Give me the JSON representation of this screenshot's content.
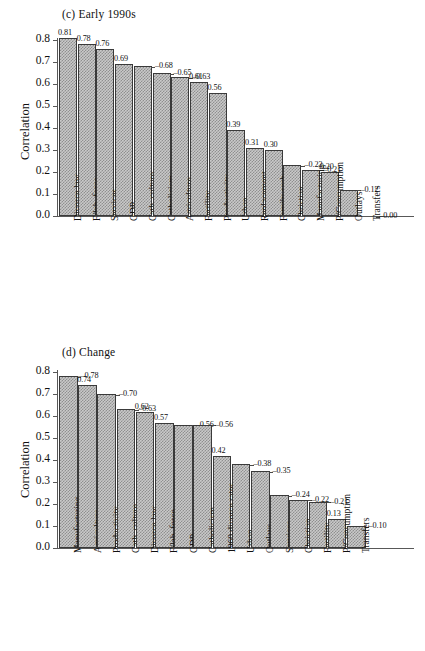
{
  "figure": {
    "ylabel": "Correlation",
    "y_ticks": [
      "0.0",
      "0.1",
      "0.2",
      "0.3",
      "0.4",
      "0.5",
      "0.6",
      "0.7",
      "0.8"
    ]
  },
  "chart_data": [
    {
      "type": "bar",
      "title": "(c) Early 1990s",
      "xlabel": "",
      "ylabel": "Correlation",
      "ylim": [
        0.0,
        0.8
      ],
      "yticks": [
        0.0,
        0.1,
        0.2,
        0.3,
        0.4,
        0.5,
        0.6,
        0.7,
        0.8
      ],
      "grid": false,
      "legend": "none",
      "categories": [
        "Divorce law",
        "F/lab. force",
        "Services",
        "GDP",
        "Cath. culture",
        "Catholicism",
        "Agriculture",
        "Fertility",
        "Productivity",
        "Urban",
        "Replacement",
        "Family cash",
        "Christian",
        "Manufacturing",
        "P/Consumption",
        "Outlays",
        "Transfers"
      ],
      "values": [
        0.81,
        0.78,
        0.76,
        0.69,
        0.68,
        0.65,
        0.63,
        0.61,
        0.56,
        0.39,
        0.31,
        0.3,
        0.23,
        0.21,
        0.2,
        0.12,
        0.0
      ],
      "labels": [
        "0.81",
        "0.78",
        "0.76",
        "0.69",
        "–0.68",
        "–0.65",
        "–0.63",
        "0.61",
        "0.56",
        "0.39",
        "0.31",
        "0.30",
        "–0.23",
        "–0.21",
        "0.20",
        "–0.12",
        "–0.00"
      ]
    },
    {
      "type": "bar",
      "title": "(d) Change",
      "xlabel": "",
      "ylabel": "Correlation",
      "ylim": [
        0.0,
        0.8
      ],
      "yticks": [
        0.0,
        0.1,
        0.2,
        0.3,
        0.4,
        0.5,
        0.6,
        0.7,
        0.8
      ],
      "grid": false,
      "legend": "none",
      "categories": [
        "Manufacturing",
        "Agriculture",
        "Productivity",
        "Cath. culture",
        "Divorce law",
        "F/lab. force",
        "GDP",
        "Catholicism",
        "1960 divorce rates",
        "Urban",
        "Outlays",
        "Services",
        "Christian",
        "Fertility",
        "P/Consumption",
        "Transfers"
      ],
      "values": [
        0.78,
        0.74,
        0.7,
        0.63,
        0.62,
        0.57,
        0.56,
        0.56,
        0.42,
        0.38,
        0.35,
        0.24,
        0.22,
        0.21,
        0.13,
        0.1
      ],
      "labels": [
        "–0.78",
        "0.74",
        "–0.70",
        "–0.63",
        "0.62",
        "0.57",
        "–0.56",
        "–0.56",
        "0.42",
        "–0.38",
        "–0.35",
        "–0.24",
        "–0.22",
        "–0.21",
        "0.13",
        "–0.10"
      ]
    }
  ]
}
